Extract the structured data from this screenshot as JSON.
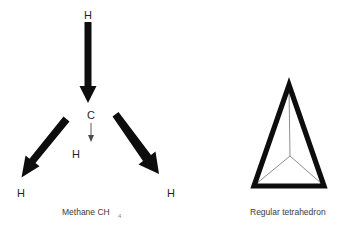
{
  "figure": {
    "background_color": "#ffffff",
    "ink_color": "#0d0d0d",
    "thin_line_color": "#4a4a4a",
    "caption_color": "#3a3a3a",
    "panels": [
      {
        "id": "methane",
        "caption_main": "Methane CH",
        "caption_subscript": "4",
        "atoms": [
          {
            "id": "h-top",
            "label": "H",
            "x": 88,
            "y": 17
          },
          {
            "id": "c-center",
            "label": "C",
            "x": 91,
            "y": 119
          },
          {
            "id": "h-front",
            "label": "H",
            "x": 76,
            "y": 155
          },
          {
            "id": "h-left",
            "label": "H",
            "x": 21,
            "y": 194
          },
          {
            "id": "h-right",
            "label": "H",
            "x": 170,
            "y": 194
          }
        ],
        "bonds": [
          {
            "id": "bond-up",
            "style": "bold-arrow",
            "from": "c-center",
            "to": "h-top"
          },
          {
            "id": "bond-left",
            "style": "bold-arrow",
            "from": "c-center",
            "to": "h-left"
          },
          {
            "id": "bond-right",
            "style": "bold-arrow",
            "from": "c-center",
            "to": "h-right"
          },
          {
            "id": "bond-front",
            "style": "thin-arrow",
            "from": "c-center",
            "to": "h-front"
          }
        ]
      },
      {
        "id": "tetrahedron",
        "caption_main": "Regular tetrahedron",
        "caption_subscript": "",
        "vertices": [
          {
            "id": "apex",
            "x": 289,
            "y": 85
          },
          {
            "id": "bottom-left",
            "x": 254,
            "y": 186
          },
          {
            "id": "bottom-right",
            "x": 324,
            "y": 186
          },
          {
            "id": "back-center",
            "x": 290,
            "y": 156
          }
        ],
        "edges": [
          {
            "id": "edge-apex-left",
            "style": "solid-thick"
          },
          {
            "id": "edge-apex-right",
            "style": "solid-thick"
          },
          {
            "id": "edge-bottom",
            "style": "solid-thick"
          },
          {
            "id": "edge-apex-back",
            "style": "thin"
          },
          {
            "id": "edge-back-left",
            "style": "thin"
          },
          {
            "id": "edge-back-right",
            "style": "thin"
          }
        ]
      }
    ]
  },
  "captions": {
    "methane_main": "Methane CH",
    "methane_subscript": "4",
    "methane_x": 62,
    "methane_y": 215,
    "tetrahedron_main": "Regular tetrahedron",
    "tetrahedron_x": 250,
    "tetrahedron_y": 215
  }
}
